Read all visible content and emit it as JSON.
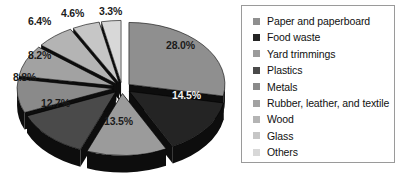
{
  "chart_data": {
    "type": "pie",
    "title": "",
    "subtitle": "",
    "xlabel": "",
    "ylabel": "",
    "grid": false,
    "legend_position": "right",
    "exploded": true,
    "three_d": true,
    "value_unit": "percent",
    "categories": [
      "Paper and paperboard",
      "Food waste",
      "Yard trimmings",
      "Plastics",
      "Metals",
      "Rubber, leather, and textile",
      "Wood",
      "Glass",
      "Others"
    ],
    "values": [
      28.0,
      14.5,
      13.5,
      12.7,
      8.8,
      8.2,
      6.4,
      4.6,
      3.3
    ],
    "data_labels": [
      "28.0%",
      "14.5%",
      "13.5%",
      "12.7%",
      "8.8%",
      "8.2%",
      "6.4%",
      "4.6%",
      "3.3%"
    ],
    "slice_colors": [
      "#8f8f8f",
      "#242424",
      "#9b9b9b",
      "#4a4a4a",
      "#8a8a8a",
      "#a2a2a2",
      "#b4b4b4",
      "#c6c6c6",
      "#d8d8d8"
    ],
    "side_color": "#0d0d0d",
    "slices": [
      {
        "label": "Paper and paperboard",
        "value": 28.0,
        "data_label": "28.0%",
        "color": "#8f8f8f"
      },
      {
        "label": "Food waste",
        "value": 14.5,
        "data_label": "14.5%",
        "color": "#242424"
      },
      {
        "label": "Yard trimmings",
        "value": 13.5,
        "data_label": "13.5%",
        "color": "#9b9b9b"
      },
      {
        "label": "Plastics",
        "value": 12.7,
        "data_label": "12.7%",
        "color": "#4a4a4a"
      },
      {
        "label": "Metals",
        "value": 8.8,
        "data_label": "8.8%",
        "color": "#8a8a8a"
      },
      {
        "label": "Rubber, leather, and textile",
        "value": 8.2,
        "data_label": "8.2%",
        "color": "#a2a2a2"
      },
      {
        "label": "Wood",
        "value": 6.4,
        "data_label": "6.4%",
        "color": "#b4b4b4"
      },
      {
        "label": "Glass",
        "value": 4.6,
        "data_label": "4.6%",
        "color": "#c6c6c6"
      },
      {
        "label": "Others",
        "value": 3.3,
        "data_label": "3.3%",
        "color": "#d8d8d8"
      }
    ]
  },
  "legend": {
    "items": [
      {
        "label": "Paper and paperboard",
        "color": "#8f8f8f"
      },
      {
        "label": "Food waste",
        "color": "#242424"
      },
      {
        "label": "Yard trimmings",
        "color": "#9b9b9b"
      },
      {
        "label": "Plastics",
        "color": "#4a4a4a"
      },
      {
        "label": "Metals",
        "color": "#8a8a8a"
      },
      {
        "label": "Rubber, leather, and textile",
        "color": "#a2a2a2"
      },
      {
        "label": "Wood",
        "color": "#b4b4b4"
      },
      {
        "label": "Glass",
        "color": "#c6c6c6"
      },
      {
        "label": "Others",
        "color": "#d8d8d8"
      }
    ]
  },
  "labels": {
    "l0": "28.0%",
    "l1": "14.5%",
    "l2": "13.5%",
    "l3": "12.7%",
    "l4": "8.8%",
    "l5": "8.2%",
    "l6": "6.4%",
    "l7": "4.6%",
    "l8": "3.3%"
  }
}
